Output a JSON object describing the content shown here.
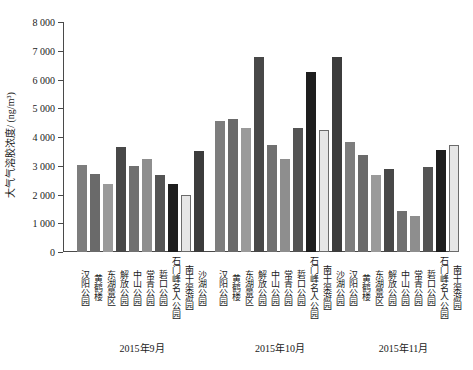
{
  "chart_data": {
    "type": "bar",
    "title": "",
    "xlabel": "",
    "ylabel": "大气气溶胶浓度/ (ng/m³)",
    "ylim": [
      0,
      8000
    ],
    "ytick_labels": [
      "0",
      "1 000",
      "2 000",
      "3 000",
      "4 000",
      "5 000",
      "6 000",
      "7 000",
      "8 000"
    ],
    "ytick_values": [
      0,
      1000,
      2000,
      3000,
      4000,
      5000,
      6000,
      7000,
      8000
    ],
    "grid": false,
    "legend": "none",
    "categories": [
      "汉阳公园",
      "黄鹤楼",
      "东湖景区",
      "解放公园",
      "中山公园",
      "常青公园",
      "硩口公园",
      "石门峰名人公园",
      "南干渠游园",
      "沙湖公园"
    ],
    "groups": [
      {
        "name": "2015年9月",
        "values": [
          3030,
          2720,
          2350,
          3660,
          2980,
          3220,
          2670,
          2350,
          1990,
          3520
        ]
      },
      {
        "name": "2015年10月",
        "values": [
          4550,
          4620,
          4330,
          6800,
          3730,
          3250,
          4330,
          6250,
          4250,
          6800
        ]
      },
      {
        "name": "2015年11月",
        "values": [
          3820,
          3380,
          2680,
          2900,
          1420,
          1250,
          2960,
          3540,
          3730
        ]
      }
    ],
    "bar_colors": [
      "#7d7d7d",
      "#6a6a6a",
      "#9a9a9a",
      "#484848",
      "#707070",
      "#8e8e8e",
      "#545454",
      "#1e1e1e",
      "#e6e6e6",
      "#3c3c3c"
    ],
    "axis_color": "#4a4a4a"
  }
}
